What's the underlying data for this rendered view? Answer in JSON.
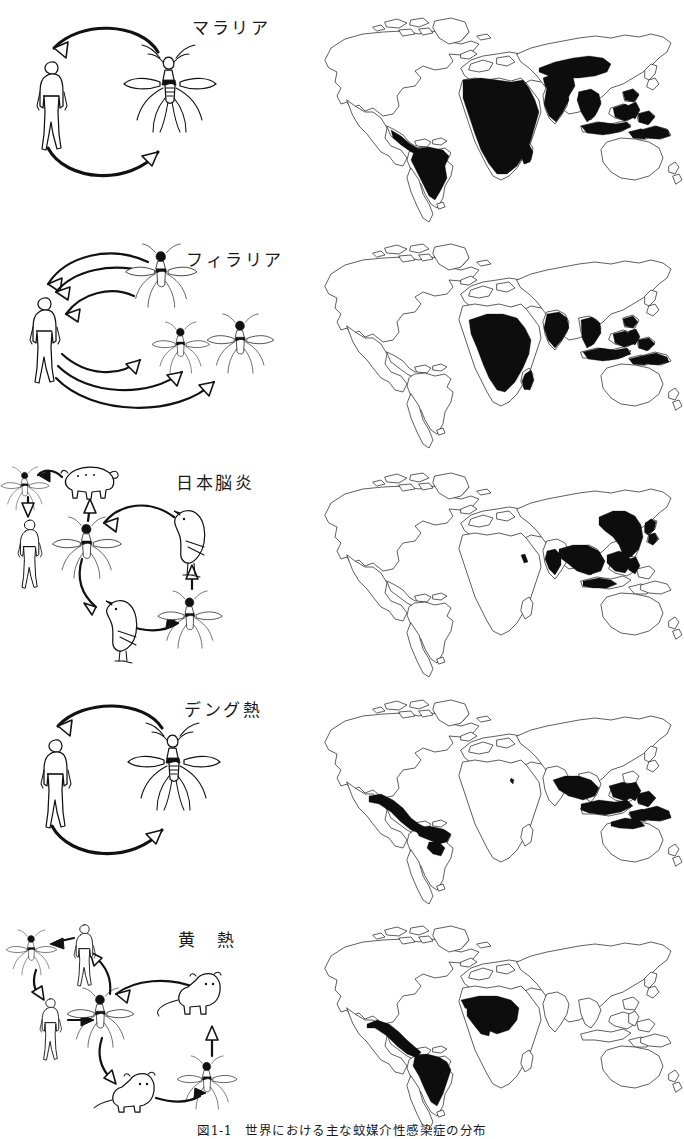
{
  "figure": {
    "caption": "図1-1　世界における主な蚊媒介性感染症の分布",
    "rows": [
      {
        "id": "malaria",
        "label": "マラリア",
        "cycle": {
          "hosts": [
            "human",
            "mosquito"
          ],
          "arrows": 2,
          "description": "ヒトと蚊の間を循環する二者間サイクル"
        },
        "map": {
          "endemic_regions": [
            "Central America",
            "Amazon / northern South America",
            "Sub-Saharan Africa",
            "Madagascar",
            "Arabian Peninsula",
            "Middle East / Turkey",
            "Indian subcontinent",
            "Indochina",
            "Indonesia",
            "Philippines",
            "New Guinea"
          ]
        }
      },
      {
        "id": "filaria",
        "label": "フィラリア",
        "cycle": {
          "hosts": [
            "human",
            "mosquito",
            "mosquito",
            "mosquito"
          ],
          "arrows": 6,
          "description": "ヒトと複数種の蚊の間を循環するサイクル"
        },
        "map": {
          "endemic_regions": [
            "Sub-Saharan Africa",
            "Indian subcontinent",
            "Southeast Asia",
            "Indonesia",
            "Philippines",
            "New Guinea"
          ]
        }
      },
      {
        "id": "japanese-encephalitis",
        "label": "日本脳炎",
        "cycle": {
          "hosts": [
            "mosquito",
            "pig",
            "human",
            "mosquito",
            "bird",
            "bird",
            "mosquito"
          ],
          "arrows": 7,
          "description": "ブタ・野鳥・蚊を介しヒトに波及するサイクル"
        },
        "map": {
          "endemic_regions": [
            "Eastern China",
            "Korea",
            "Japan",
            "Southeast Asia",
            "Indian subcontinent",
            "Philippines",
            "Indonesia"
          ]
        }
      },
      {
        "id": "dengue",
        "label": "デング熱",
        "cycle": {
          "hosts": [
            "human",
            "mosquito"
          ],
          "arrows": 2,
          "description": "ヒトと蚊の間を循環する二者間サイクル"
        },
        "map": {
          "endemic_regions": [
            "Central America / Caribbean",
            "Northern South America",
            "Southeast Asia",
            "Indonesia",
            "Philippines",
            "New Guinea",
            "Northern Australia"
          ]
        }
      },
      {
        "id": "yellow-fever",
        "label": "黄　熱",
        "cycle": {
          "hosts": [
            "mosquito",
            "human",
            "human",
            "mosquito",
            "monkey",
            "monkey",
            "mosquito"
          ],
          "arrows": 7,
          "description": "都市型（ヒト‐蚊）と森林型（サル‐蚊）の二つのサイクル"
        },
        "map": {
          "endemic_regions": [
            "Central America",
            "Amazon / northern South America",
            "West Africa",
            "Central Africa"
          ]
        }
      }
    ]
  },
  "style": {
    "ink_color": "#111111",
    "fill_color": "#0d0d0d",
    "background": "#ffffff"
  }
}
